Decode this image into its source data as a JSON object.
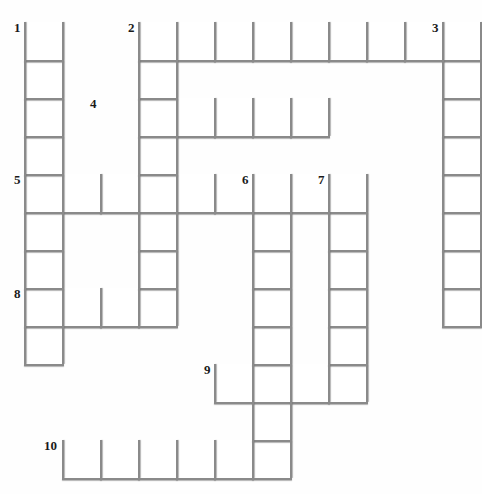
{
  "puzzle": {
    "title": "Crossword Grid",
    "type": "crossword-grid",
    "grid": {
      "cell_size": 38,
      "origin_x": 24,
      "origin_y": 22,
      "columns": 12,
      "rows": 12,
      "line_color": "#8a8a8a",
      "cell_color": "#ffffff",
      "background_color": "#ffffff",
      "number_color": "#1a1a1a"
    },
    "clue_numbers": [
      {
        "label": "1",
        "col": 0,
        "row": 0
      },
      {
        "label": "2",
        "col": 3,
        "row": 0
      },
      {
        "label": "3",
        "col": 11,
        "row": 0
      },
      {
        "label": "4",
        "col": 2,
        "row": 2
      },
      {
        "label": "5",
        "col": 0,
        "row": 4
      },
      {
        "label": "6",
        "col": 6,
        "row": 4
      },
      {
        "label": "7",
        "col": 8,
        "row": 4
      },
      {
        "label": "8",
        "col": 0,
        "row": 7
      },
      {
        "label": "9",
        "col": 5,
        "row": 9
      },
      {
        "label": "10",
        "col": 1,
        "row": 11
      }
    ],
    "entries": [
      {
        "number": "1",
        "direction": "down",
        "col": 0,
        "row": 0,
        "length": 10
      },
      {
        "number": "2",
        "direction": "across",
        "col": 3,
        "row": 0,
        "length": 8
      },
      {
        "number": "2",
        "direction": "down",
        "col": 3,
        "row": 0,
        "length": 9
      },
      {
        "number": "3",
        "direction": "down",
        "col": 11,
        "row": 0,
        "length": 8
      },
      {
        "number": "4",
        "direction": "across",
        "col": 3,
        "row": 2,
        "length": 5
      },
      {
        "number": "5",
        "direction": "across",
        "col": 0,
        "row": 4,
        "length": 9
      },
      {
        "number": "6",
        "direction": "down",
        "col": 6,
        "row": 4,
        "length": 7
      },
      {
        "number": "7",
        "direction": "down",
        "col": 8,
        "row": 4,
        "length": 5
      },
      {
        "number": "8",
        "direction": "across",
        "col": 0,
        "row": 7,
        "length": 4
      },
      {
        "number": "9",
        "direction": "across",
        "col": 5,
        "row": 9,
        "length": 4
      },
      {
        "number": "10",
        "direction": "across",
        "col": 1,
        "row": 11,
        "length": 6
      }
    ],
    "cells": [
      {
        "col": 0,
        "row": 0
      },
      {
        "col": 3,
        "row": 0
      },
      {
        "col": 4,
        "row": 0
      },
      {
        "col": 5,
        "row": 0
      },
      {
        "col": 6,
        "row": 0
      },
      {
        "col": 7,
        "row": 0
      },
      {
        "col": 8,
        "row": 0
      },
      {
        "col": 9,
        "row": 0
      },
      {
        "col": 10,
        "row": 0
      },
      {
        "col": 11,
        "row": 0
      },
      {
        "col": 0,
        "row": 1
      },
      {
        "col": 3,
        "row": 1
      },
      {
        "col": 11,
        "row": 1
      },
      {
        "col": 0,
        "row": 2
      },
      {
        "col": 3,
        "row": 2
      },
      {
        "col": 4,
        "row": 2
      },
      {
        "col": 5,
        "row": 2
      },
      {
        "col": 6,
        "row": 2
      },
      {
        "col": 7,
        "row": 2
      },
      {
        "col": 11,
        "row": 2
      },
      {
        "col": 0,
        "row": 3
      },
      {
        "col": 3,
        "row": 3
      },
      {
        "col": 11,
        "row": 3
      },
      {
        "col": 0,
        "row": 4
      },
      {
        "col": 1,
        "row": 4
      },
      {
        "col": 2,
        "row": 4
      },
      {
        "col": 3,
        "row": 4
      },
      {
        "col": 4,
        "row": 4
      },
      {
        "col": 5,
        "row": 4
      },
      {
        "col": 6,
        "row": 4
      },
      {
        "col": 7,
        "row": 4
      },
      {
        "col": 8,
        "row": 4
      },
      {
        "col": 11,
        "row": 4
      },
      {
        "col": 0,
        "row": 5
      },
      {
        "col": 3,
        "row": 5
      },
      {
        "col": 6,
        "row": 5
      },
      {
        "col": 8,
        "row": 5
      },
      {
        "col": 11,
        "row": 5
      },
      {
        "col": 0,
        "row": 6
      },
      {
        "col": 3,
        "row": 6
      },
      {
        "col": 6,
        "row": 6
      },
      {
        "col": 8,
        "row": 6
      },
      {
        "col": 11,
        "row": 6
      },
      {
        "col": 0,
        "row": 7
      },
      {
        "col": 1,
        "row": 7
      },
      {
        "col": 2,
        "row": 7
      },
      {
        "col": 3,
        "row": 7
      },
      {
        "col": 6,
        "row": 7
      },
      {
        "col": 8,
        "row": 7
      },
      {
        "col": 11,
        "row": 7
      },
      {
        "col": 0,
        "row": 8
      },
      {
        "col": 6,
        "row": 8
      },
      {
        "col": 8,
        "row": 8
      },
      {
        "col": 5,
        "row": 9
      },
      {
        "col": 6,
        "row": 9
      },
      {
        "col": 7,
        "row": 9
      },
      {
        "col": 8,
        "row": 9
      },
      {
        "col": 6,
        "row": 10
      },
      {
        "col": 1,
        "row": 11
      },
      {
        "col": 2,
        "row": 11
      },
      {
        "col": 3,
        "row": 11
      },
      {
        "col": 4,
        "row": 11
      },
      {
        "col": 5,
        "row": 11
      },
      {
        "col": 6,
        "row": 11
      }
    ]
  }
}
